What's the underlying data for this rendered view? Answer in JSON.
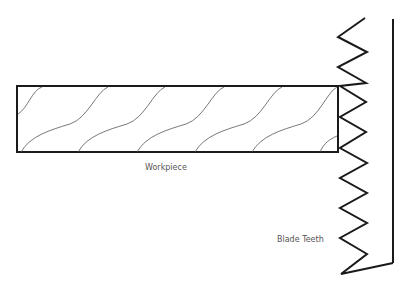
{
  "diagram": {
    "labels": {
      "workpiece": "Workpiece",
      "blade_teeth": "Blade Teeth"
    },
    "colors": {
      "stroke": "#1a1a1a",
      "grain": "#555555",
      "label": "#555555",
      "background": "#ffffff"
    },
    "components": [
      "workpiece",
      "wood-grain",
      "blade-teeth",
      "blade-back"
    ]
  }
}
